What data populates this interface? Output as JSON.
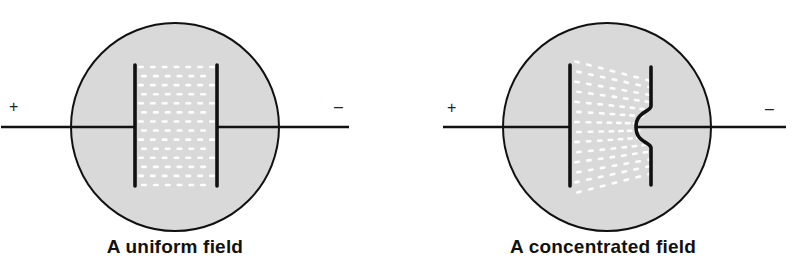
{
  "colors": {
    "background": "#ffffff",
    "circle_fill": "#d9d9d9",
    "stroke": "#111111",
    "field_dash": "#ffffff"
  },
  "figures": [
    {
      "id": "uniform",
      "caption": "A uniform field",
      "positive_sign": "+",
      "negative_sign": "–",
      "circle": {
        "cx": 175,
        "cy": 127,
        "r": 104
      },
      "wire": {
        "x1": 1,
        "x2": 349,
        "y": 127
      },
      "plate_left": {
        "x": 135,
        "y1": 65,
        "y2": 186
      },
      "plate_right": {
        "x": 217,
        "y1": 65,
        "y2": 186,
        "bulge": false
      },
      "field": {
        "x1": 141,
        "x2": 212,
        "y1": 67,
        "y2": 185,
        "rows": 14,
        "cols": 7,
        "skew": 0
      },
      "caption_x": 175,
      "plus_pos": {
        "x": 9,
        "y": 99
      },
      "minus_pos": {
        "x": 334,
        "y": 99
      }
    },
    {
      "id": "concentrated",
      "caption": "A concentrated field",
      "positive_sign": "+",
      "negative_sign": "–",
      "circle": {
        "cx": 607,
        "cy": 127,
        "r": 104
      },
      "wire": {
        "x1": 443,
        "x2": 786,
        "y": 127
      },
      "plate_left": {
        "x": 570,
        "y1": 65,
        "y2": 186
      },
      "plate_right": {
        "x": 651,
        "y1": 67,
        "y2": 185,
        "bulge": true,
        "bulge_x": 636,
        "bulge_y1": 106,
        "bulge_y2": 148
      },
      "field": {
        "x1": 577,
        "x2": 648,
        "y1": 62,
        "y2": 192,
        "rows": 14,
        "cols": 7,
        "skew": 1
      },
      "caption_x": 603,
      "plus_pos": {
        "x": 447,
        "y": 100
      },
      "minus_pos": {
        "x": 765,
        "y": 101
      }
    }
  ]
}
